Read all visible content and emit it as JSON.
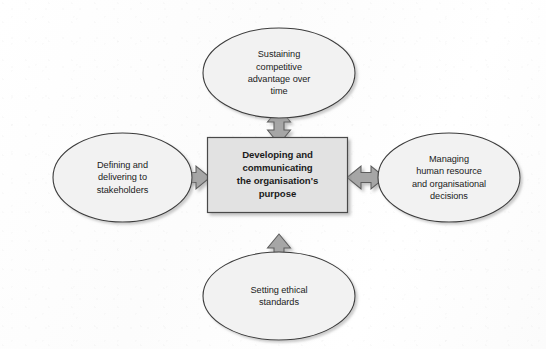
{
  "diagram": {
    "title": "Developing and communicating the organisation's purpose",
    "type": "hub-and-spoke",
    "background_color": "#fdfdfd",
    "center": {
      "shape": "rectangle",
      "label": "Developing and communicating the organisation's purpose",
      "lines": [
        "Developing and",
        "communicating",
        "the organisation's",
        "purpose"
      ],
      "fill_color": "#e2e2e2",
      "stroke_color": "#4a4a4a"
    },
    "nodes": [
      {
        "id": "top",
        "shape": "ellipse",
        "label": "Sustaining competitive advantage over time",
        "lines": [
          "Sustaining",
          "competitive",
          "advantage over",
          "time"
        ],
        "fill_color": "#f2f2f2",
        "stroke_color": "#3c3c3c"
      },
      {
        "id": "left",
        "shape": "ellipse",
        "label": "Defining and delivering to stakeholders",
        "lines": [
          "Defining and",
          "delivering to",
          "stakeholders"
        ],
        "fill_color": "#f2f2f2",
        "stroke_color": "#3c3c3c"
      },
      {
        "id": "right",
        "shape": "ellipse",
        "label": "Managing human resource and organisational decisions",
        "lines": [
          "Managing",
          "human resource",
          "and organisational",
          "decisions"
        ],
        "fill_color": "#f2f2f2",
        "stroke_color": "#3c3c3c"
      },
      {
        "id": "bottom",
        "shape": "ellipse",
        "label": "Setting ethical standards",
        "lines": [
          "Setting ethical",
          "standards"
        ],
        "fill_color": "#f2f2f2",
        "stroke_color": "#3c3c3c"
      }
    ],
    "connectors": [
      {
        "id": "center-top",
        "style": "double-headed-arrow",
        "orientation": "vertical",
        "from": "center",
        "to": "top",
        "fill_color": "#a6a6a6",
        "stroke_color": "#5a5a5a"
      },
      {
        "id": "center-bottom",
        "style": "double-headed-arrow",
        "orientation": "vertical",
        "from": "center",
        "to": "bottom",
        "fill_color": "#a6a6a6",
        "stroke_color": "#5a5a5a"
      },
      {
        "id": "center-left",
        "style": "double-headed-arrow",
        "orientation": "horizontal",
        "from": "center",
        "to": "left",
        "fill_color": "#a6a6a6",
        "stroke_color": "#5a5a5a"
      },
      {
        "id": "center-right",
        "style": "double-headed-arrow",
        "orientation": "horizontal",
        "from": "center",
        "to": "right",
        "fill_color": "#a6a6a6",
        "stroke_color": "#5a5a5a"
      }
    ]
  }
}
